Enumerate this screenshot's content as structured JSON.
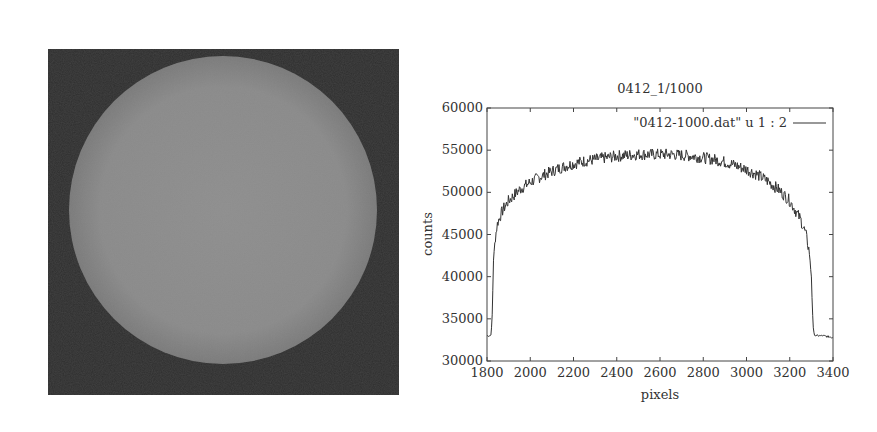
{
  "left_image": {
    "description": "Full-disk solar image, grayscale",
    "background_color": "#2e2e2e",
    "disk_color": "#8a8a8a"
  },
  "chart_data": {
    "type": "line",
    "title": "0412_1/1000",
    "xlabel": "pixels",
    "ylabel": "counts",
    "xlim": [
      1800,
      3400
    ],
    "ylim": [
      30000,
      60000
    ],
    "xticks": [
      1800,
      2000,
      2200,
      2400,
      2600,
      2800,
      3000,
      3200,
      3400
    ],
    "yticks": [
      30000,
      35000,
      40000,
      45000,
      50000,
      55000,
      60000
    ],
    "grid": false,
    "legend_position": "top-right",
    "series": [
      {
        "name": "\"0412-1000.dat\" u 1 : 2",
        "color": "#333333",
        "x": [
          1800,
          1815,
          1820,
          1825,
          1830,
          1840,
          1850,
          1875,
          1900,
          1950,
          2000,
          2050,
          2100,
          2150,
          2200,
          2250,
          2300,
          2350,
          2400,
          2450,
          2500,
          2550,
          2600,
          2650,
          2700,
          2750,
          2800,
          2850,
          2900,
          2950,
          3000,
          3050,
          3100,
          3150,
          3200,
          3250,
          3275,
          3290,
          3300,
          3305,
          3310,
          3320,
          3350,
          3400
        ],
        "y": [
          33000,
          33000,
          33300,
          36000,
          42000,
          45000,
          46500,
          48000,
          49000,
          50300,
          51200,
          51900,
          52500,
          53000,
          53400,
          53700,
          53900,
          54100,
          54300,
          54400,
          54500,
          54500,
          54500,
          54500,
          54400,
          54300,
          54100,
          53900,
          53600,
          53200,
          52700,
          52100,
          51300,
          50300,
          49000,
          46800,
          45000,
          43000,
          40000,
          36000,
          33300,
          33000,
          33000,
          32800
        ]
      }
    ]
  }
}
